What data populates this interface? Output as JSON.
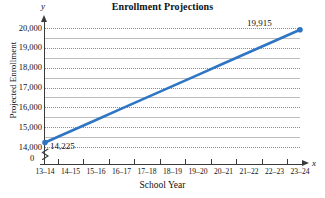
{
  "chart_data": {
    "type": "line",
    "title": "Enrollment Projections",
    "xlabel": "School Year",
    "ylabel": "Projected Enrollment",
    "x": [
      "13–14",
      "14–15",
      "15–16",
      "16–17",
      "17–18",
      "18–19",
      "19–20",
      "20–21",
      "21–22",
      "22–23",
      "23–24"
    ],
    "categories": [
      "13–14",
      "14–15",
      "15–16",
      "16–17",
      "17–18",
      "18–19",
      "19–20",
      "20–21",
      "21–22",
      "22–23",
      "23–24"
    ],
    "values": [
      14225,
      14794,
      15363,
      15932,
      16501,
      17070,
      17639,
      18208,
      18777,
      19346,
      19915
    ],
    "series": [
      {
        "name": "Projected Enrollment",
        "color": "#2E75C4",
        "values": [
          14225,
          14794,
          15363,
          15932,
          16501,
          17070,
          17639,
          18208,
          18777,
          19346,
          19915
        ]
      }
    ],
    "ylim": [
      14000,
      20000
    ],
    "y_ticks": [
      14000,
      15000,
      16000,
      17000,
      18000,
      19000,
      20000
    ],
    "y_tick_labels": [
      "14,000",
      "15,000",
      "16,000",
      "17,000",
      "18,000",
      "19,000",
      "20,000"
    ],
    "y_minor_ticks": [
      14500,
      15500,
      16500,
      17500,
      18500,
      19500
    ],
    "y_axis_broken": true,
    "origin_label": "0",
    "grid": true,
    "grid_style": "dotted-major-solid-minor",
    "legend": "none",
    "annotations": [
      {
        "label": "14,225",
        "x": "13–14",
        "y": 14225,
        "position": "right"
      },
      {
        "label": "19,915",
        "x": "23–24",
        "y": 19915,
        "position": "left"
      }
    ],
    "axis_letters": {
      "x": "x",
      "y": "y"
    }
  },
  "axes": {
    "y_letter": "y",
    "x_letter": "x"
  },
  "colors": {
    "line": "#2E75C4",
    "marker": "#2E75C4",
    "axis": "#3a3a3a",
    "grid_major": "#8b8b8b",
    "grid_minor": "#bdbdbd",
    "text": "#111111",
    "background": "#ffffff"
  }
}
